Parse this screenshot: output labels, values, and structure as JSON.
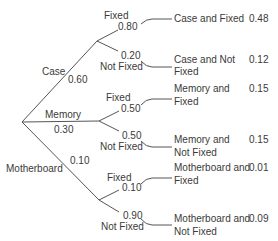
{
  "root": {
    "label": ""
  },
  "level1": [
    {
      "label": "Case",
      "prob": "0.60"
    },
    {
      "label": "Memory",
      "prob": "0.30"
    },
    {
      "label": "Motherboard",
      "prob": "0.10"
    }
  ],
  "level2": [
    {
      "label": "Fixed",
      "prob": "0.80"
    },
    {
      "label": "Not Fixed",
      "prob": "0.20"
    },
    {
      "label": "Fixed",
      "prob": "0.50"
    },
    {
      "label": "Not Fixed",
      "prob": "0.50"
    },
    {
      "label": "Fixed",
      "prob": "0.10"
    },
    {
      "label": "Not Fixed",
      "prob": "0.90"
    }
  ],
  "outcomes": [
    {
      "line1": "Case and Fixed",
      "line2": "",
      "prob": "0.48"
    },
    {
      "line1": "Case and Not",
      "line2": "Fixed",
      "prob": "0.12"
    },
    {
      "line1": "Memory and",
      "line2": "Fixed",
      "prob": "0.15"
    },
    {
      "line1": "Memory and",
      "line2": "Not Fixed",
      "prob": "0.15"
    },
    {
      "line1": "Motherboard and",
      "line2": "Fixed",
      "prob": "0.01"
    },
    {
      "line1": "Motherboard and",
      "line2": "Not Fixed",
      "prob": "0.09"
    }
  ]
}
